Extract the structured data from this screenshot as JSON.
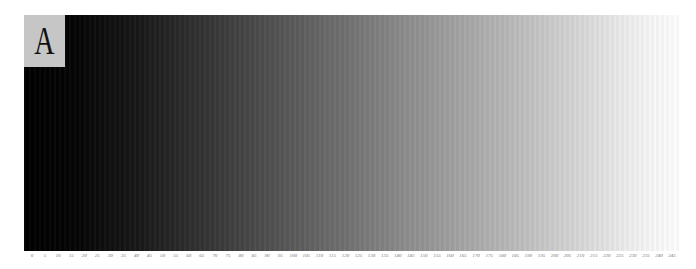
{
  "panel": {
    "label": "A",
    "label_background": "#c6c6c6"
  },
  "gradient": {
    "start_color": "#000000",
    "end_color": "#ffffff",
    "direction": "left-to-right"
  },
  "scale": {
    "ticks": [
      "0",
      "5",
      "10",
      "15",
      "20",
      "25",
      "30",
      "35",
      "40",
      "45",
      "50",
      "55",
      "60",
      "65",
      "70",
      "75",
      "80",
      "85",
      "90",
      "95",
      "100",
      "105",
      "110",
      "115",
      "120",
      "125",
      "130",
      "135",
      "140",
      "145",
      "150",
      "155",
      "160",
      "165",
      "170",
      "175",
      "180",
      "185",
      "190",
      "195",
      "200",
      "205",
      "210",
      "215",
      "220",
      "225",
      "230",
      "235",
      "240",
      "245"
    ]
  }
}
